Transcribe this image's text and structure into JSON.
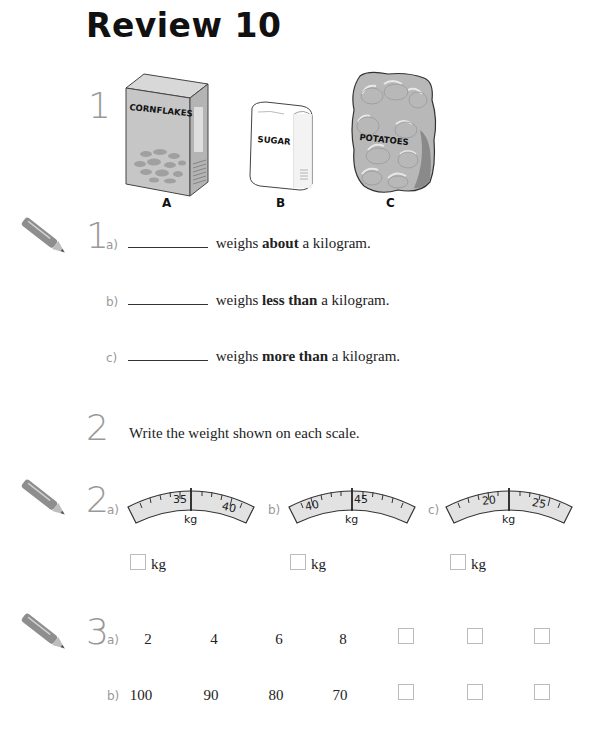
{
  "page": {
    "title": "Review 10"
  },
  "question1": {
    "number": "1",
    "items": [
      {
        "label": "A",
        "text": "CORNFLAKES"
      },
      {
        "label": "B",
        "text": "SUGAR"
      },
      {
        "label": "C",
        "text": "POTATOES"
      }
    ]
  },
  "exercise1": {
    "number": "1",
    "parts": [
      {
        "letter": "a)",
        "before": " weighs ",
        "bold": "about",
        "after": " a kilogram."
      },
      {
        "letter": "b)",
        "before": " weighs ",
        "bold": "less than",
        "after": " a kilogram."
      },
      {
        "letter": "c)",
        "before": " weighs ",
        "bold": "more than",
        "after": " a kilogram."
      }
    ]
  },
  "question2": {
    "number": "2",
    "instruction": "Write the weight shown on each scale."
  },
  "exercise2": {
    "number": "2",
    "scales": [
      {
        "letter": "a)",
        "labels": [
          "35",
          "40"
        ],
        "unit": "kg",
        "answer_unit": "kg"
      },
      {
        "letter": "b)",
        "labels": [
          "40",
          "45"
        ],
        "unit": "kg",
        "answer_unit": "kg"
      },
      {
        "letter": "c)",
        "labels": [
          "20",
          "25"
        ],
        "unit": "kg",
        "answer_unit": "kg"
      }
    ]
  },
  "exercise3": {
    "number": "3",
    "rows": [
      {
        "letter": "a)",
        "values": [
          "2",
          "4",
          "6",
          "8"
        ],
        "blanks": 3
      },
      {
        "letter": "b)",
        "values": [
          "100",
          "90",
          "80",
          "70"
        ],
        "blanks": 3
      }
    ]
  },
  "colors": {
    "number_gray": "#999999",
    "pencil_gray": "#888888",
    "scale_fill": "#e2e2e2",
    "item_fill": "#c8c8c8"
  }
}
